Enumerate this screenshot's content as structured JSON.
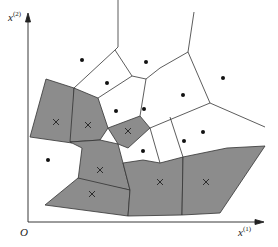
{
  "diagram": {
    "type": "voronoi-tessellation",
    "colors": {
      "shaded_cell": "#8c8c8c",
      "edge": "#333333",
      "axis": "#222222",
      "background": "#ffffff"
    },
    "axes": {
      "x_label": "x",
      "x_sup": "(1)",
      "y_label": "x",
      "y_sup": "(2)",
      "origin_label": "O"
    },
    "legend_semantics": {
      "dot": "instance of class 1 (unshaded cell)",
      "cross": "instance of class 2 (shaded cell)"
    },
    "dots": [
      [
        82,
        60
      ],
      [
        146,
        62
      ],
      [
        223,
        78
      ],
      [
        183,
        95
      ],
      [
        107,
        83
      ],
      [
        116,
        111
      ],
      [
        144,
        109
      ],
      [
        184,
        141
      ],
      [
        203,
        132
      ],
      [
        143,
        151
      ],
      [
        48,
        160
      ]
    ],
    "crosses": [
      [
        56,
        122
      ],
      [
        88,
        125
      ],
      [
        128,
        131
      ],
      [
        100,
        170
      ],
      [
        92,
        194
      ],
      [
        160,
        182
      ],
      [
        206,
        182
      ]
    ]
  }
}
